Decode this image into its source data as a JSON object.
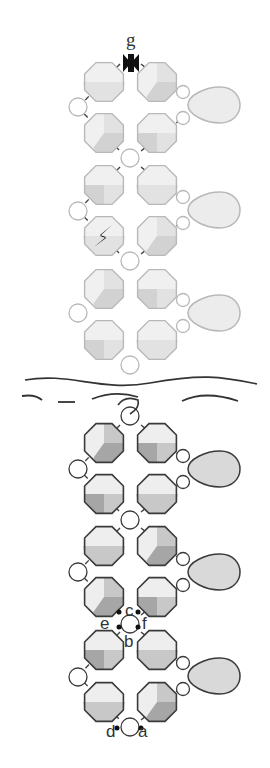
{
  "diagram": {
    "colors": {
      "faded_stroke": "#b8b8b8",
      "faded_fill_light": "#f0f0f0",
      "faded_fill_mid": "#e2e2e2",
      "faded_fill_dark": "#d2d2d2",
      "bold_stroke": "#3a3a3a",
      "bold_fill_light": "#eeeeee",
      "bold_fill_mid": "#c8c8c8",
      "bold_fill_dark": "#a6a6a6",
      "thread": "#444444",
      "marker": "#111111"
    },
    "labels": [
      {
        "id": "g",
        "text": "g",
        "x": 126,
        "y": 30,
        "serif": true
      },
      {
        "id": "c",
        "text": "c",
        "x": 125,
        "y": 602
      },
      {
        "id": "e",
        "text": "e",
        "x": 100,
        "y": 615
      },
      {
        "id": "f",
        "text": "f",
        "x": 142,
        "y": 615
      },
      {
        "id": "b",
        "text": "b",
        "x": 124,
        "y": 633
      },
      {
        "id": "d",
        "text": "d",
        "x": 106,
        "y": 723
      },
      {
        "id": "a",
        "text": "a",
        "x": 138,
        "y": 723
      }
    ],
    "sections": [
      {
        "name": "upper-faded",
        "octagon_rows": [
          82,
          133,
          185,
          236,
          289,
          340
        ],
        "left_circles": [
          107,
          211,
          313
        ],
        "center_circles": [
          158,
          261,
          365
        ],
        "drops": [
          105,
          210,
          313
        ],
        "thread_rows": 4
      },
      {
        "name": "lower-bold",
        "octagon_rows": [
          443,
          494,
          546,
          597,
          650,
          702
        ],
        "left_circles": [
          469,
          572,
          677
        ],
        "center_circles": [
          416,
          520,
          624,
          727
        ],
        "drops": [
          469,
          572,
          676
        ]
      }
    ],
    "markers": {
      "bowtie": {
        "name": "start-marker-g",
        "x": 131,
        "y": 63
      },
      "lightning": {
        "name": "break-marker",
        "x": 103,
        "y": 236
      }
    },
    "break_lines": {
      "wave": "M25 380 C 70 372, 100 392, 150 383 S 220 376, 257 384",
      "dashes": [
        "M22 396 Q 35 394 42 400",
        "M58 402 L 75 402",
        "M92 399 Q 115 390 138 397",
        "M182 401 Q 205 390 238 401"
      ],
      "hook": "M118 405 Q 125 395 138 400 Q 140 408 130 414"
    }
  }
}
